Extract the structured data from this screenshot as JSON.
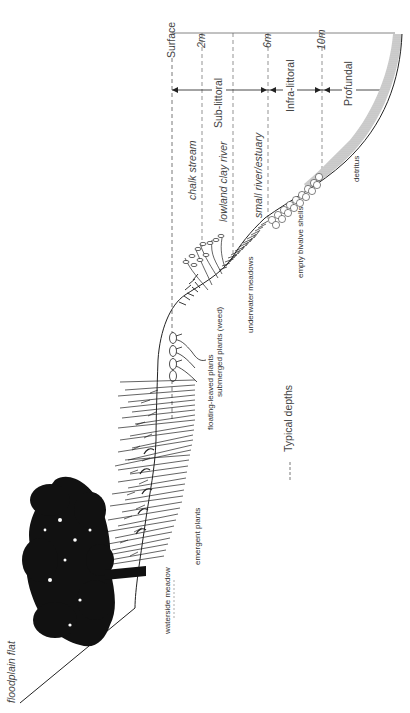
{
  "figure": {
    "orientation": "rotated 90 degrees counter-clockwise",
    "depth_markers": [
      {
        "label": "Surface",
        "x": 172
      },
      {
        "label": "2m",
        "x": 202
      },
      {
        "label": "6m",
        "x": 268
      },
      {
        "label": "10m",
        "x": 322
      }
    ],
    "zones": [
      {
        "label": "Sub-littoral",
        "from": "Surface",
        "to": "6m"
      },
      {
        "label": "Infra-littoral",
        "from": "6m",
        "to": "10m"
      },
      {
        "label": "Profundal",
        "from": "10m",
        "to": "bottom"
      }
    ],
    "river_types": [
      {
        "label": "chalk stream",
        "depth_line": "2m"
      },
      {
        "label": "lowland clay river",
        "depth_line": "4m"
      },
      {
        "label": "small river/estuary",
        "depth_line": "6m"
      }
    ],
    "habitat_labels": [
      {
        "label": "floodplain flat"
      },
      {
        "label": "waterside meadow"
      },
      {
        "label": "emergent plants"
      },
      {
        "label": "floating-leaved plants"
      },
      {
        "label": "submerged plants (weed)"
      },
      {
        "label": "underwater meadows"
      },
      {
        "label": "empty bivalve shells"
      },
      {
        "label": "detritus"
      }
    ],
    "legend": {
      "symbol": "dashed-line",
      "label": "Typical depths"
    }
  }
}
